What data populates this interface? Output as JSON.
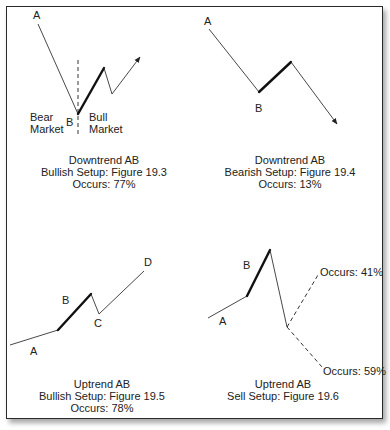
{
  "panels": [
    {
      "id": "downtrend-bullish",
      "point_labels": {
        "A": "A",
        "B": "B"
      },
      "side_labels": {
        "left": [
          "Bear",
          "Market"
        ],
        "right": [
          "Bull",
          "Market"
        ]
      },
      "caption": [
        "Downtrend AB",
        "Bullish Setup: Figure 19.3",
        "Occurs: 77%"
      ]
    },
    {
      "id": "downtrend-bearish",
      "point_labels": {
        "A": "A",
        "B": "B"
      },
      "caption": [
        "Downtrend AB",
        "Bearish Setup: Figure 19.4",
        "Occurs: 13%"
      ]
    },
    {
      "id": "uptrend-bullish",
      "point_labels": {
        "A": "A",
        "B": "B",
        "C": "C",
        "D": "D"
      },
      "caption": [
        "Uptrend AB",
        "Bullish Setup: Figure 19.5",
        "Occurs: 78%"
      ]
    },
    {
      "id": "uptrend-sell",
      "point_labels": {
        "A": "A",
        "B": "B"
      },
      "branch_labels": {
        "up": "Occurs: 41%",
        "down": "Occurs: 59%"
      },
      "caption": [
        "Uptrend AB",
        "Sell Setup: Figure 19.6"
      ]
    }
  ]
}
